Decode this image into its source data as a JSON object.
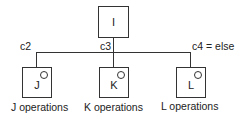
{
  "diagram": {
    "root": {
      "label": "I"
    },
    "conditions": [
      "c2",
      "c3",
      "c4 = else"
    ],
    "children": [
      {
        "label": "J",
        "caption": "J operations"
      },
      {
        "label": "K",
        "caption": "K operations"
      },
      {
        "label": "L",
        "caption": "L operations"
      }
    ]
  }
}
